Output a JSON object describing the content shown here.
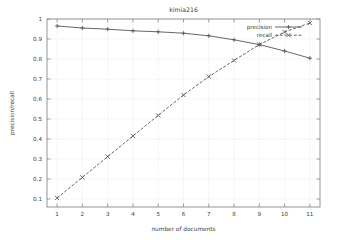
{
  "chart_data": {
    "type": "line",
    "title": "kimia216",
    "xlabel": "number of documents",
    "ylabel": "precision/recall",
    "xlim": [
      0.6,
      11.4
    ],
    "ylim": [
      0.06,
      1.0
    ],
    "grid": true,
    "legend_position": "top-right",
    "x": [
      1,
      2,
      3,
      4,
      5,
      6,
      7,
      8,
      9,
      10,
      11
    ],
    "xticks": [
      "1",
      "2",
      "3",
      "4",
      "5",
      "6",
      "7",
      "8",
      "9",
      "10",
      "11"
    ],
    "yticks": [
      "0.1",
      "0.2",
      "0.3",
      "0.4",
      "0.5",
      "0.6",
      "0.7",
      "0.8",
      "0.9",
      "1"
    ],
    "ytick_values": [
      0.1,
      0.2,
      0.3,
      0.4,
      0.5,
      0.6,
      0.7,
      0.8,
      0.9,
      1.0
    ],
    "series": [
      {
        "name": "precision",
        "marker": "plus",
        "dash": "solid",
        "color": "#555555",
        "values": [
          0.965,
          0.955,
          0.949,
          0.941,
          0.936,
          0.929,
          0.916,
          0.896,
          0.872,
          0.84,
          0.804
        ]
      },
      {
        "name": "recall",
        "marker": "cross",
        "dash": "dashed",
        "color": "#555555",
        "values": [
          0.105,
          0.208,
          0.312,
          0.415,
          0.518,
          0.62,
          0.712,
          0.793,
          0.872,
          0.935,
          0.98
        ]
      }
    ]
  },
  "axes": {
    "title": "kimia216",
    "xlabel": "number of documents",
    "ylabel": "precision/recall"
  },
  "legend": {
    "items": [
      {
        "label": "precision"
      },
      {
        "label": "recall"
      }
    ]
  },
  "style": {
    "background": "#ffffff",
    "frame_color": "#8a8a8a",
    "grid_color": "#d8d8d8",
    "text_color": "#3a3a3a",
    "line_color": "#555555"
  }
}
